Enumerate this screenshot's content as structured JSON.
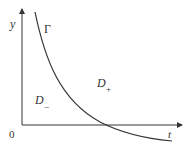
{
  "diagram": {
    "axes": {
      "y_label": "y",
      "x_label": "t",
      "origin_label": "0"
    },
    "curve": {
      "label": "Γ",
      "shape": "decreasing convex curve crossing the t-axis"
    },
    "regions": {
      "upper": {
        "letter": "D",
        "sub": "+"
      },
      "lower": {
        "letter": "D",
        "sub": "−"
      }
    },
    "colors": {
      "line": "#333333",
      "background": "#ffffff"
    }
  }
}
